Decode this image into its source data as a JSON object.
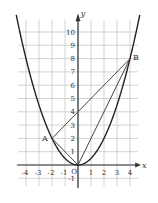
{
  "diagram": {
    "type": "coordinate-plane",
    "curve": "y = x^2 / 2",
    "axes": {
      "x_label": "x",
      "y_label": "y",
      "origin_label": "O"
    },
    "x_ticks": [
      "-4",
      "-3",
      "-2",
      "-1",
      "1",
      "2",
      "3",
      "4"
    ],
    "y_ticks": [
      "-1",
      "1",
      "2",
      "3",
      "4",
      "5",
      "6",
      "7",
      "8",
      "9",
      "10"
    ],
    "points": [
      {
        "label": "A",
        "x": -2,
        "y": 2
      },
      {
        "label": "B",
        "x": 4,
        "y": 8
      },
      {
        "label": "O",
        "x": 0,
        "y": 0
      }
    ],
    "segments": [
      [
        "A",
        "B"
      ],
      [
        "A",
        "O"
      ],
      [
        "O",
        "B"
      ]
    ],
    "colors": {
      "grid": "#c8c8c8",
      "curve": "#222222",
      "lines": "#444444",
      "axis": "#333333"
    }
  }
}
